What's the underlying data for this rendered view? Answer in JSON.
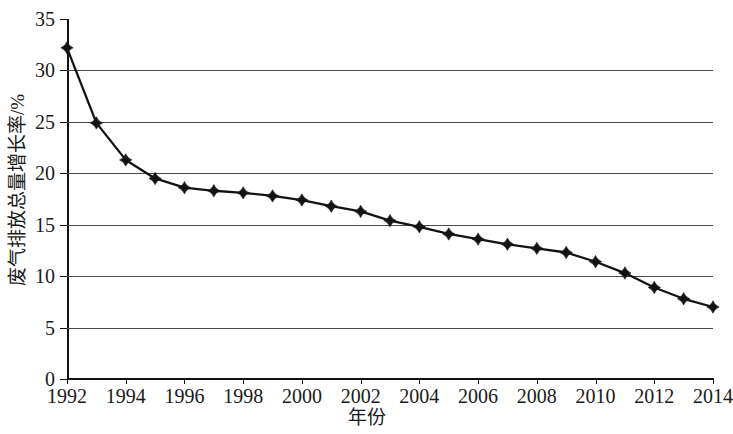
{
  "chart_data": {
    "type": "line",
    "title": "",
    "xlabel": "年份",
    "ylabel": "废气排放总量增长率/%",
    "x": [
      1992,
      1993,
      1994,
      1995,
      1996,
      1997,
      1998,
      1999,
      2000,
      2001,
      2002,
      2003,
      2004,
      2005,
      2006,
      2007,
      2008,
      2009,
      2010,
      2011,
      2012,
      2013,
      2014
    ],
    "values": [
      32.2,
      24.9,
      21.3,
      19.5,
      18.6,
      18.3,
      18.1,
      17.8,
      17.4,
      16.8,
      16.3,
      15.4,
      14.8,
      14.1,
      13.6,
      13.1,
      12.7,
      12.3,
      11.4,
      10.3,
      8.9,
      7.8,
      7.0
    ],
    "series": [
      {
        "name": "废气排放总量增长率",
        "values": [
          32.2,
          24.9,
          21.3,
          19.5,
          18.6,
          18.3,
          18.1,
          17.8,
          17.4,
          16.8,
          16.3,
          15.4,
          14.8,
          14.1,
          13.6,
          13.1,
          12.7,
          12.3,
          11.4,
          10.3,
          8.9,
          7.8,
          7.0
        ]
      }
    ],
    "ylim": [
      0,
      35
    ],
    "xlim": [
      1992,
      2014
    ],
    "yticks": [
      0,
      5,
      10,
      15,
      20,
      25,
      30,
      35
    ],
    "ytick_labels": [
      "0",
      "5",
      "10",
      "15",
      "20",
      "25",
      "30",
      "35"
    ],
    "xticks": [
      1992,
      1994,
      1996,
      1998,
      2000,
      2002,
      2004,
      2006,
      2008,
      2010,
      2012,
      2014
    ],
    "xtick_labels": [
      "1992",
      "1994",
      "1996",
      "1998",
      "2000",
      "2002",
      "2004",
      "2006",
      "2008",
      "2010",
      "2012",
      "2014"
    ],
    "grid": "horizontal",
    "legend": "none",
    "marker": "diamond",
    "line_color": "#131313",
    "marker_color": "#131313",
    "grid_color": "#4a4a4a",
    "background_color": "#ffffff"
  }
}
